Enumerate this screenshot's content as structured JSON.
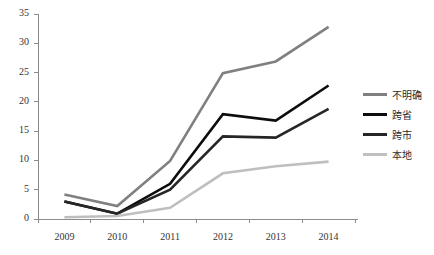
{
  "chart_data": {
    "type": "line",
    "title": "",
    "xlabel": "",
    "ylabel": "",
    "categories": [
      "2009",
      "2010",
      "2011",
      "2012",
      "2013",
      "2014"
    ],
    "ylim": [
      0,
      35
    ],
    "ytick_step": 5,
    "yticks": [
      "0",
      "5",
      "10",
      "15",
      "20",
      "25",
      "30",
      "35"
    ],
    "grid": false,
    "legend_position": "right",
    "series": [
      {
        "name": "不明确",
        "color": "#808080",
        "values": [
          4.2,
          2.2,
          9.9,
          24.9,
          26.9,
          32.8
        ]
      },
      {
        "name": "跨省",
        "color": "#0d0d0d",
        "values": [
          3.0,
          0.9,
          6.0,
          17.9,
          16.8,
          22.8
        ]
      },
      {
        "name": "跨市",
        "color": "#262626",
        "values": [
          3.0,
          0.9,
          5.0,
          14.1,
          13.9,
          18.8
        ]
      },
      {
        "name": "本地",
        "color": "#bfbfbf",
        "values": [
          0.3,
          0.5,
          1.9,
          7.8,
          9.0,
          9.8
        ]
      }
    ]
  },
  "axis": {
    "line_color": "#8c8c8c"
  }
}
